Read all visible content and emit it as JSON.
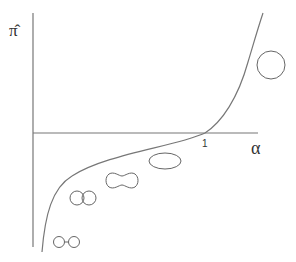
{
  "diagram": {
    "y_axis_label": "π̂",
    "x_axis_label": "α",
    "x_tick_label": "1",
    "colors": {
      "line": "#777777",
      "shape": "#666666",
      "text": "#333333"
    },
    "shapes": [
      {
        "name": "two-separated-droplets",
        "description": "two small circles joined by a neck"
      },
      {
        "name": "two-touching-droplets",
        "description": "two overlapping circles"
      },
      {
        "name": "peanut-shape",
        "description": "dumbbell / peanut shaped vesicle"
      },
      {
        "name": "prolate-ellipse",
        "description": "ellipse"
      },
      {
        "name": "sphere",
        "description": "circle"
      }
    ]
  }
}
